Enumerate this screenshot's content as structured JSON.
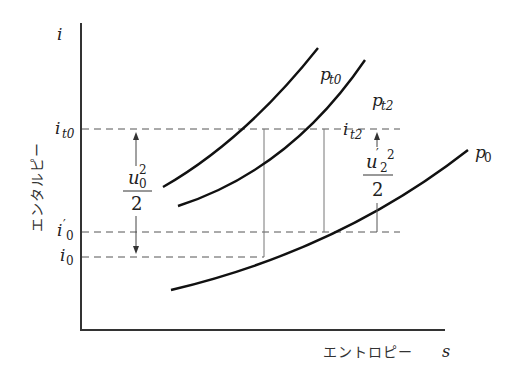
{
  "diagram": {
    "axes": {
      "y_label_symbol": "i",
      "y_label_text": "エンタルピー",
      "x_label_text": "エントロピー",
      "x_label_symbol": "s"
    },
    "levels": {
      "i_t0": {
        "main": "i",
        "sub": "t0"
      },
      "i_prime_0": {
        "main": "i",
        "prime": "′",
        "sub": "0"
      },
      "i_0": {
        "main": "i",
        "sub": "0"
      },
      "i_t2": {
        "main": "i",
        "sub": "t2"
      }
    },
    "curves": {
      "p_t0": {
        "main": "p",
        "sub": "t0"
      },
      "p_t2": {
        "main": "p",
        "sub": "t2"
      },
      "p_0": {
        "main": "p",
        "sub": "0"
      }
    },
    "annotations": {
      "u0_frac": {
        "num_main": "u",
        "num_sub": "0",
        "num_sup": "2",
        "den": "2"
      },
      "u2_frac": {
        "num_main": "u",
        "num_prime": "′",
        "num_sub": "2",
        "num_sup": "2",
        "den": "2"
      }
    },
    "colors": {
      "curve": "#111111",
      "axis": "#333333",
      "dashed": "#555555",
      "thin": "#777777"
    }
  }
}
